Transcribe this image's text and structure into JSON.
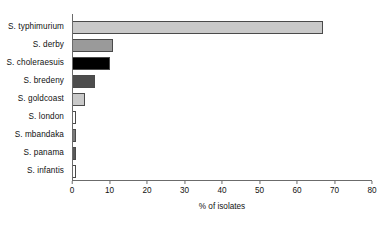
{
  "chart_data": {
    "type": "bar",
    "orientation": "horizontal",
    "title": "",
    "xlabel": "% of isolates",
    "ylabel": "",
    "xlim": [
      0,
      80
    ],
    "xticks": [
      0,
      10,
      20,
      30,
      40,
      50,
      60,
      70,
      80
    ],
    "grid": false,
    "legend": false,
    "categories": [
      "S. typhimurium",
      "S. derby",
      "S. choleraesuis",
      "S. bredeny",
      "S. goldcoast",
      "S. london",
      "S. mbandaka",
      "S. panama",
      "S. infantis"
    ],
    "values": [
      67,
      11,
      10,
      6,
      3.5,
      1,
      1,
      1,
      1
    ],
    "bar_colors": [
      "#c9c9c9",
      "#9a9a9a",
      "#000000",
      "#4d4d4d",
      "#c9c9c9",
      "#ffffff",
      "#7a7a7a",
      "#5a5a5a",
      "#ffffff"
    ],
    "bar_edge_color": "#4a4a4a",
    "axis_color": "#6b6b6b",
    "background": "#ffffff"
  }
}
